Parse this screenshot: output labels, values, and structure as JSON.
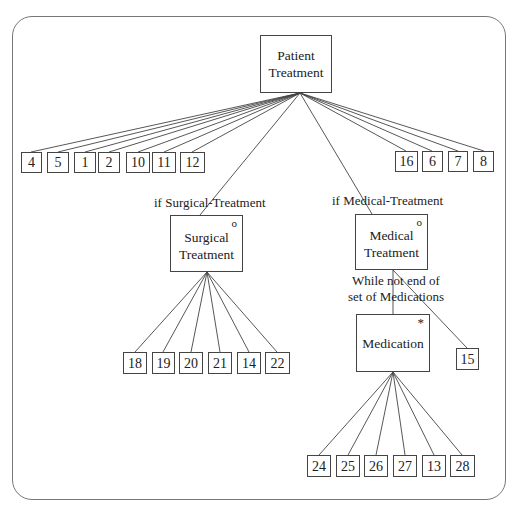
{
  "diagram": {
    "type": "structure chart (JSP tree)",
    "root": {
      "label": "Patient Treatment"
    },
    "root_leaves_left": [
      "4",
      "5",
      "1",
      "2",
      "10",
      "11",
      "12"
    ],
    "root_leaves_right": [
      "16",
      "6",
      "7",
      "8"
    ],
    "surgical": {
      "condition": "if Surgical-Treatment",
      "label": "Surgical Treatment",
      "line1": "Surgical",
      "line2": "Treatment",
      "marker": "o",
      "leaves": [
        "18",
        "19",
        "20",
        "21",
        "14",
        "22"
      ]
    },
    "medical": {
      "condition": "if Medical-Treatment",
      "label": "Medical Treatment",
      "line1": "Medical",
      "line2": "Treatment",
      "marker": "o",
      "loop_condition_line1": "While not end of",
      "loop_condition_line2": "set of Medications",
      "leaves": [
        "15"
      ]
    },
    "medication": {
      "label": "Medication",
      "marker": "*",
      "leaves": [
        "24",
        "25",
        "26",
        "27",
        "13",
        "28"
      ]
    }
  },
  "root": {
    "line1": "Patient",
    "line2": "Treatment"
  }
}
